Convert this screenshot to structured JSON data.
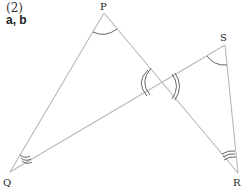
{
  "problem": {
    "number": "(2)",
    "unknowns": "a, b"
  },
  "figure": {
    "points": {
      "P": "P",
      "Q": "Q",
      "R": "R",
      "S": "S"
    },
    "segments": [
      "PQ",
      "PR",
      "QS",
      "SR"
    ],
    "angle_marks": [
      {
        "vertex": "P",
        "arcs": 1
      },
      {
        "vertex": "S",
        "arcs": 1
      },
      {
        "vertex": "Q",
        "arcs": 3
      },
      {
        "vertex": "R",
        "arcs": 3
      },
      {
        "vertex": "intersection-left",
        "arcs": 2
      },
      {
        "vertex": "intersection-right",
        "arcs": 2
      }
    ]
  }
}
